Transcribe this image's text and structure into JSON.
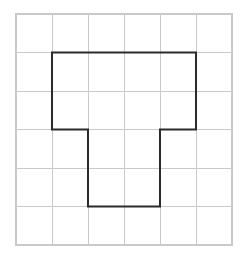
{
  "figure": {
    "background_color": "#ffffff",
    "canvas": {
      "width": 241,
      "height": 257
    }
  },
  "grid": {
    "name": "square-grid",
    "columns": 6,
    "rows": 6,
    "origin_x": 16,
    "origin_y": 14,
    "cell_width": 36,
    "cell_height": 38.5,
    "line_color": "#c9c9c9",
    "line_width": 1,
    "border_color": "#c9c9c9",
    "visible": true
  },
  "shape": {
    "name": "cross-notched-polygon",
    "type": "polygon",
    "closed": true,
    "stroke_color": "#2b2b2b",
    "stroke_width": 2,
    "fill": "none",
    "vertex_count": 8,
    "vertices_cells": [
      [
        1,
        1
      ],
      [
        5,
        1
      ],
      [
        5,
        3
      ],
      [
        4,
        3
      ],
      [
        4,
        5
      ],
      [
        2,
        5
      ],
      [
        2,
        3
      ],
      [
        1,
        3
      ]
    ],
    "vertices_px": [
      [
        52,
        52.5
      ],
      [
        196,
        52.5
      ],
      [
        196,
        129.5
      ],
      [
        160,
        129.5
      ],
      [
        160,
        206.5
      ],
      [
        88,
        206.5
      ],
      [
        88,
        129.5
      ],
      [
        52,
        129.5
      ]
    ],
    "area_cells": 12,
    "perimeter_cells": 16
  },
  "chart_data": {
    "type": "scatter",
    "xlabel": "",
    "ylabel": "",
    "xlim": [
      0,
      6
    ],
    "ylim": [
      0,
      6
    ],
    "grid": true,
    "legend": "none",
    "series": [
      {
        "name": "polygon-outline",
        "x": [
          1,
          5,
          5,
          4,
          4,
          2,
          2,
          1,
          1
        ],
        "y": [
          1,
          1,
          3,
          3,
          5,
          5,
          3,
          3,
          1
        ]
      }
    ]
  }
}
